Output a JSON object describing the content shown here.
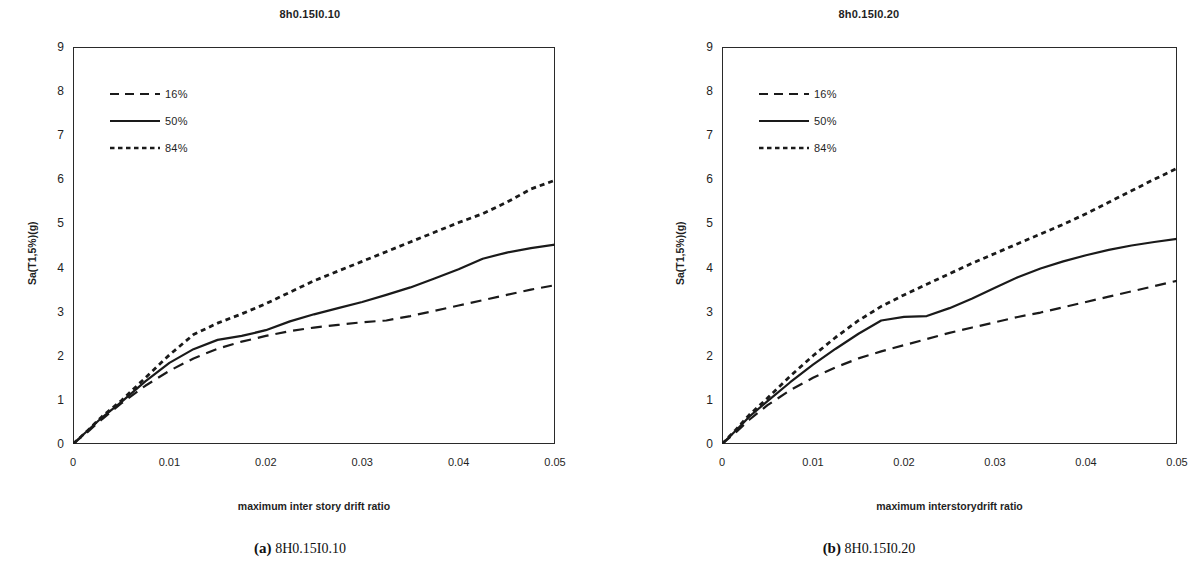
{
  "figure": {
    "panels": [
      {
        "id": "panel-a",
        "title": "8h0.15I0.10",
        "caption_tag": "(a)",
        "caption_text": "8H0.15I0.10",
        "xlabel": "maximum inter story drift ratio",
        "ylabel": "Sa(T1,5%)(g)"
      },
      {
        "id": "panel-b",
        "title": "8h0.15I0.20",
        "caption_tag": "(b)",
        "caption_text": "8H0.15I0.20",
        "xlabel": "maximum interstorydrift ratio",
        "ylabel": "Sa(T1,5%)(g)"
      }
    ]
  },
  "chart_data": [
    {
      "type": "line",
      "title": "8h0.15I0.10",
      "xlabel": "maximum inter story drift ratio",
      "ylabel": "Sa(T1,5%)(g)",
      "xlim": [
        0,
        0.05
      ],
      "ylim": [
        0,
        9
      ],
      "xticks": [
        0,
        0.01,
        0.02,
        0.03,
        0.04,
        0.05
      ],
      "xticklabels": [
        "0",
        "0.01",
        "0.02",
        "0.03",
        "0.04",
        "0.05"
      ],
      "yticks": [
        0,
        1,
        2,
        3,
        4,
        5,
        6,
        7,
        8,
        9
      ],
      "yticklabels": [
        "0",
        "1",
        "2",
        "3",
        "4",
        "5",
        "6",
        "7",
        "8",
        "9"
      ],
      "grid": false,
      "legend_position": "upper-left",
      "series": [
        {
          "name": "16%",
          "style": "dashed",
          "color": "#1a1a1a",
          "x": [
            0.0,
            0.0015,
            0.003,
            0.005,
            0.0075,
            0.01,
            0.0125,
            0.015,
            0.0175,
            0.02,
            0.0225,
            0.025,
            0.0275,
            0.03,
            0.0325,
            0.035,
            0.0375,
            0.04,
            0.0425,
            0.045,
            0.0475,
            0.05
          ],
          "y": [
            0.0,
            0.27,
            0.56,
            0.92,
            1.32,
            1.66,
            1.94,
            2.16,
            2.32,
            2.45,
            2.56,
            2.64,
            2.7,
            2.76,
            2.8,
            2.9,
            3.02,
            3.14,
            3.26,
            3.38,
            3.5,
            3.6
          ]
        },
        {
          "name": "50%",
          "style": "solid",
          "color": "#1a1a1a",
          "x": [
            0.0,
            0.0015,
            0.003,
            0.005,
            0.0075,
            0.01,
            0.0125,
            0.015,
            0.0175,
            0.02,
            0.0225,
            0.025,
            0.0275,
            0.03,
            0.0325,
            0.035,
            0.0375,
            0.04,
            0.0425,
            0.045,
            0.0475,
            0.05
          ],
          "y": [
            0.0,
            0.3,
            0.6,
            0.95,
            1.42,
            1.84,
            2.15,
            2.36,
            2.45,
            2.58,
            2.78,
            2.94,
            3.08,
            3.22,
            3.38,
            3.55,
            3.75,
            3.96,
            4.2,
            4.34,
            4.44,
            4.52
          ]
        },
        {
          "name": "84%",
          "style": "dotted",
          "color": "#1a1a1a",
          "x": [
            0.0,
            0.0015,
            0.003,
            0.005,
            0.0075,
            0.01,
            0.0125,
            0.015,
            0.0175,
            0.02,
            0.0225,
            0.025,
            0.0275,
            0.03,
            0.0325,
            0.035,
            0.0375,
            0.04,
            0.0425,
            0.045,
            0.0475,
            0.05
          ],
          "y": [
            0.0,
            0.3,
            0.62,
            0.98,
            1.5,
            2.02,
            2.48,
            2.74,
            2.95,
            3.18,
            3.44,
            3.7,
            3.92,
            4.14,
            4.36,
            4.58,
            4.8,
            5.02,
            5.22,
            5.48,
            5.78,
            5.98
          ]
        }
      ]
    },
    {
      "type": "line",
      "title": "8h0.15I0.20",
      "xlabel": "maximum interstorydrift ratio",
      "ylabel": "Sa(T1,5%)(g)",
      "xlim": [
        0,
        0.05
      ],
      "ylim": [
        0,
        9
      ],
      "xticks": [
        0,
        0.01,
        0.02,
        0.03,
        0.04,
        0.05
      ],
      "xticklabels": [
        "0",
        "0.01",
        "0.02",
        "0.03",
        "0.04",
        "0.05"
      ],
      "yticks": [
        0,
        1,
        2,
        3,
        4,
        5,
        6,
        7,
        8,
        9
      ],
      "yticklabels": [
        "0",
        "1",
        "2",
        "3",
        "4",
        "5",
        "6",
        "7",
        "8",
        "9"
      ],
      "grid": false,
      "legend_position": "upper-left",
      "series": [
        {
          "name": "16%",
          "style": "dashed",
          "color": "#1a1a1a",
          "x": [
            0.0,
            0.0015,
            0.003,
            0.005,
            0.0075,
            0.01,
            0.0125,
            0.015,
            0.0175,
            0.02,
            0.0225,
            0.025,
            0.0275,
            0.03,
            0.0325,
            0.035,
            0.0375,
            0.04,
            0.0425,
            0.045,
            0.0475,
            0.05
          ],
          "y": [
            0.0,
            0.26,
            0.55,
            0.88,
            1.22,
            1.5,
            1.74,
            1.94,
            2.1,
            2.24,
            2.38,
            2.52,
            2.64,
            2.76,
            2.88,
            2.98,
            3.1,
            3.22,
            3.34,
            3.46,
            3.58,
            3.7
          ]
        },
        {
          "name": "50%",
          "style": "solid",
          "color": "#1a1a1a",
          "x": [
            0.0,
            0.0015,
            0.003,
            0.005,
            0.0075,
            0.01,
            0.0125,
            0.015,
            0.0175,
            0.02,
            0.0225,
            0.025,
            0.0275,
            0.03,
            0.0325,
            0.035,
            0.0375,
            0.04,
            0.0425,
            0.045,
            0.0475,
            0.05
          ],
          "y": [
            0.0,
            0.3,
            0.62,
            0.97,
            1.4,
            1.8,
            2.16,
            2.5,
            2.8,
            2.88,
            2.9,
            3.08,
            3.3,
            3.54,
            3.78,
            3.98,
            4.14,
            4.28,
            4.4,
            4.5,
            4.58,
            4.65
          ]
        },
        {
          "name": "84%",
          "style": "dotted",
          "color": "#1a1a1a",
          "x": [
            0.0,
            0.0015,
            0.003,
            0.005,
            0.0075,
            0.01,
            0.0125,
            0.015,
            0.0175,
            0.02,
            0.0225,
            0.025,
            0.0275,
            0.03,
            0.0325,
            0.035,
            0.0375,
            0.04,
            0.0425,
            0.045,
            0.0475,
            0.05
          ],
          "y": [
            0.0,
            0.32,
            0.66,
            1.04,
            1.54,
            2.0,
            2.42,
            2.8,
            3.12,
            3.38,
            3.62,
            3.86,
            4.1,
            4.32,
            4.54,
            4.76,
            4.98,
            5.22,
            5.48,
            5.74,
            6.0,
            6.25
          ]
        }
      ]
    }
  ],
  "legend": {
    "items": [
      {
        "label": "16%",
        "style": "dashed"
      },
      {
        "label": "50%",
        "style": "solid"
      },
      {
        "label": "84%",
        "style": "dotted"
      }
    ]
  }
}
